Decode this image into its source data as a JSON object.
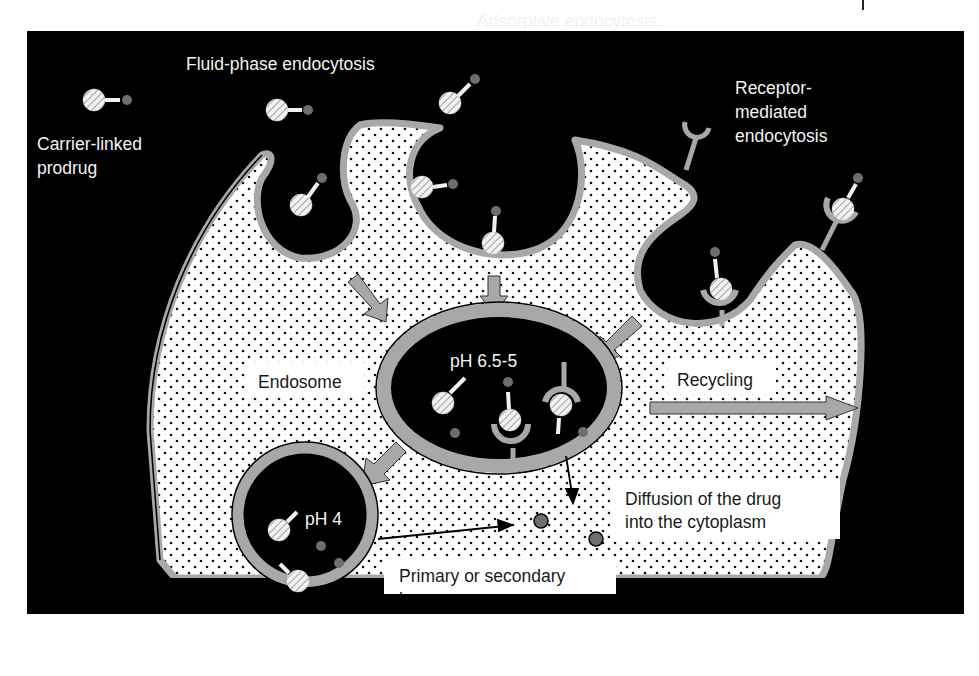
{
  "figure": {
    "type": "diagram",
    "colors": {
      "background": "#000000",
      "cytoplasm": "#ffffff",
      "membrane": "#a8a8a8",
      "arrow": "#a8a8a8",
      "drug": "#6e6e6e",
      "carrier": "#f0f0f0",
      "text_light": "#f2f2f2",
      "text_dark": "#1a1a1a"
    }
  },
  "labels": {
    "carrier_linked_prodrug": [
      "Carrier-linked",
      "prodrug"
    ],
    "fluid_phase": "Fluid-phase endocytosis",
    "adsorptive": "Adsorptive endocytosis",
    "receptor_mediated": [
      "Receptor-",
      "mediated",
      "endocytosis"
    ],
    "endosome": "Endosome",
    "endosome_ph": "pH 6.5-5",
    "recycling": "Recycling",
    "lysosome_ph": "pH 4",
    "lysosome": [
      "Primary or secondary",
      "lysosome"
    ],
    "diffusion": [
      "Diffusion of the drug",
      "into the cytoplasm"
    ]
  },
  "legend_symbols": {
    "carrier": "hatched-circle",
    "linker": "white-bar",
    "drug": "grey-dot",
    "receptor": "cup-shaped-receptor"
  }
}
